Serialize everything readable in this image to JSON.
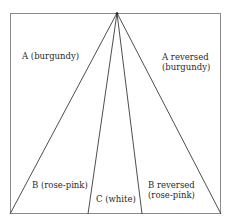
{
  "diagram": {
    "type": "fan-division",
    "colors": {
      "line": "#3a3a3a",
      "border": "#8a8a8a",
      "background": "#ffffff",
      "text": "#2a2a2a"
    },
    "frame": {
      "x": 10,
      "y": 13,
      "width": 211,
      "height": 201
    },
    "apex": {
      "x": 117,
      "y": 13
    },
    "ray_endpoints_bottom": [
      10,
      88,
      142,
      221
    ],
    "regions": [
      {
        "id": "A",
        "line1": "A (burgundy)",
        "line2": ""
      },
      {
        "id": "A-reversed",
        "line1": "A reversed",
        "line2": "(burgundy)"
      },
      {
        "id": "B",
        "line1": "B (rose-pink)",
        "line2": ""
      },
      {
        "id": "C",
        "line1": "C (white)",
        "line2": ""
      },
      {
        "id": "B-reversed",
        "line1": "B reversed",
        "line2": "(rose-pink)"
      }
    ]
  }
}
